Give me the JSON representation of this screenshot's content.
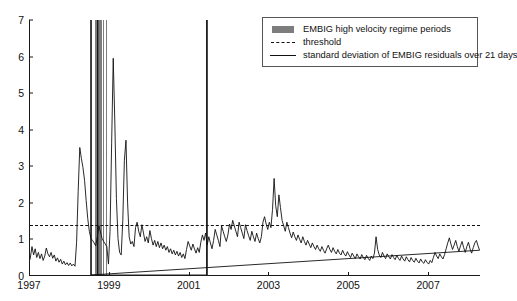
{
  "chart_data": {
    "type": "line",
    "title": "",
    "xlabel": "",
    "ylabel": "",
    "xlim": [
      1997.0,
      2008.3
    ],
    "ylim": [
      0,
      7
    ],
    "grid": false,
    "legend_position": "top-right",
    "xticks": [
      1997,
      1999,
      2001,
      2003,
      2005,
      2007
    ],
    "xtick_labels": [
      "1997",
      "1999",
      "2001",
      "2003",
      "2005",
      "2007"
    ],
    "yticks": [
      0,
      1,
      2,
      3,
      4,
      5,
      6,
      7
    ],
    "ytick_labels": [
      "0",
      "1",
      "2",
      "3",
      "4",
      "5",
      "6",
      "7"
    ],
    "threshold": 1.4,
    "colors": {
      "band": "#7d7d7d",
      "line": "#111111",
      "threshold": "#111111",
      "axis": "#1a1a1a"
    },
    "legend": [
      {
        "key": "band",
        "label": "EMBIG high velocity regime periods"
      },
      {
        "key": "dashed",
        "label": "threshold"
      },
      {
        "key": "solid",
        "label": "standard deviation of EMBIG residuals over 21 days"
      }
    ],
    "regime_bands": [
      {
        "start": 1998.52,
        "end": 1998.56
      },
      {
        "start": 1998.63,
        "end": 1998.8
      },
      {
        "start": 1998.83,
        "end": 1998.86
      },
      {
        "start": 1998.9,
        "end": 1998.93
      },
      {
        "start": 2001.42,
        "end": 2001.47
      }
    ],
    "series": [
      {
        "name": "standard deviation of EMBIG residuals over 21 days",
        "x": [
          1997.0,
          1997.05,
          1997.09,
          1997.13,
          1997.17,
          1997.21,
          1997.25,
          1997.29,
          1997.33,
          1997.37,
          1997.41,
          1997.45,
          1997.49,
          1997.53,
          1997.57,
          1997.61,
          1997.65,
          1997.69,
          1997.73,
          1997.77,
          1997.81,
          1997.85,
          1997.89,
          1997.93,
          1997.97,
          1998.01,
          1998.05,
          1998.09,
          1998.13,
          1998.17,
          1998.21,
          1998.25,
          1998.29,
          1998.33,
          1998.37,
          1998.41,
          1998.45,
          1998.49,
          1998.53,
          1998.57,
          1998.61,
          1998.65,
          1998.69,
          1998.73,
          1998.77,
          1998.81,
          1998.85,
          1998.89,
          1998.93,
          1998.97,
          1999.01,
          1999.05,
          1999.09,
          1999.13,
          1999.17,
          1999.21,
          1999.25,
          1999.29,
          1999.33,
          1999.37,
          1999.41,
          1999.45,
          1999.49,
          1999.53,
          1999.57,
          1999.61,
          1999.65,
          1999.69,
          1999.73,
          1999.77,
          1999.81,
          1999.85,
          1999.89,
          1999.93,
          1999.97,
          2000.01,
          2000.05,
          2000.09,
          2000.13,
          2000.17,
          2000.21,
          2000.25,
          2000.29,
          2000.33,
          2000.37,
          2000.41,
          2000.45,
          2000.49,
          2000.53,
          2000.57,
          2000.61,
          2000.65,
          2000.69,
          2000.73,
          2000.77,
          2000.81,
          2000.85,
          2000.89,
          2000.93,
          2000.97,
          2001.01,
          2001.05,
          2001.09,
          2001.13,
          2001.17,
          2001.21,
          2001.25,
          2001.29,
          2001.33,
          2001.37,
          2001.41,
          2001.45,
          2001.49,
          2001.53,
          2001.57,
          2001.61,
          2001.65,
          2001.69,
          2001.73,
          2001.77,
          2001.81,
          2001.85,
          2001.89,
          2001.93,
          2001.97,
          2002.01,
          2002.05,
          2002.09,
          2002.13,
          2002.17,
          2002.21,
          2002.25,
          2002.29,
          2002.33,
          2002.37,
          2002.41,
          2002.45,
          2002.49,
          2002.53,
          2002.57,
          2002.61,
          2002.65,
          2002.69,
          2002.73,
          2002.77,
          2002.81,
          2002.85,
          2002.89,
          2002.93,
          2002.97,
          2003.01,
          2003.05,
          2003.09,
          2003.13,
          2003.17,
          2003.21,
          2003.25,
          2003.29,
          2003.33,
          2003.37,
          2003.41,
          2003.45,
          2003.49,
          2003.53,
          2003.57,
          2003.61,
          2003.65,
          2003.69,
          2003.73,
          2003.77,
          2003.81,
          2003.85,
          2003.89,
          2003.93,
          2003.97,
          2004.01,
          2004.05,
          2004.09,
          2004.13,
          2004.17,
          2004.21,
          2004.25,
          2004.29,
          2004.33,
          2004.37,
          2004.41,
          2004.45,
          2004.49,
          2004.53,
          2004.57,
          2004.61,
          2004.65,
          2004.69,
          2004.73,
          2004.77,
          2004.81,
          2004.85,
          2004.89,
          2004.93,
          2004.97,
          2005.01,
          2005.05,
          2005.09,
          2005.13,
          2005.17,
          2005.21,
          2005.25,
          2005.29,
          2005.33,
          2005.37,
          2005.41,
          2005.45,
          2005.49,
          2005.53,
          2005.57,
          2005.61,
          2005.65,
          2005.69,
          2005.73,
          2005.77,
          2005.81,
          2005.85,
          2005.89,
          2005.93,
          2005.97,
          2006.01,
          2006.05,
          2006.09,
          2006.13,
          2006.17,
          2006.21,
          2006.25,
          2006.29,
          2006.33,
          2006.37,
          2006.41,
          2006.45,
          2006.49,
          2006.53,
          2006.57,
          2006.61,
          2006.65,
          2006.69,
          2006.73,
          2006.77,
          2006.81,
          2006.85,
          2006.89,
          2006.93,
          2006.97,
          2007.01,
          2007.05,
          2007.09,
          2007.13,
          2007.17,
          2007.21,
          2007.25,
          2007.29,
          2007.33,
          2007.37,
          2007.41,
          2007.45,
          2007.49,
          2007.53,
          2007.57,
          2007.61,
          2007.65,
          2007.69,
          2007.73,
          2007.77,
          2007.81,
          2007.85,
          2007.89,
          2007.93,
          2007.97,
          2008.01,
          2008.05,
          2008.09,
          2008.13,
          2008.17,
          2008.21,
          2008.25,
          2008.29
        ],
        "y": [
          0.42,
          0.78,
          0.55,
          0.72,
          0.48,
          0.62,
          0.45,
          0.58,
          0.4,
          0.52,
          0.74,
          0.58,
          0.5,
          0.62,
          0.46,
          0.55,
          0.38,
          0.47,
          0.35,
          0.43,
          0.3,
          0.38,
          0.28,
          0.34,
          0.26,
          0.33,
          0.25,
          0.3,
          0.24,
          0.9,
          2.3,
          3.5,
          3.2,
          2.95,
          2.6,
          2.05,
          1.55,
          1.2,
          1.0,
          0.95,
          0.88,
          0.8,
          1.05,
          1.35,
          1.18,
          1.0,
          0.92,
          0.85,
          0.78,
          0.3,
          1.2,
          3.6,
          5.95,
          4.2,
          2.1,
          1.0,
          0.62,
          0.55,
          1.5,
          3.15,
          3.7,
          2.0,
          1.05,
          0.85,
          0.92,
          0.78,
          1.3,
          1.45,
          1.2,
          1.05,
          1.38,
          1.15,
          0.92,
          1.05,
          0.88,
          1.22,
          1.0,
          0.82,
          0.95,
          0.78,
          0.92,
          0.75,
          0.88,
          0.72,
          0.82,
          0.68,
          0.78,
          0.62,
          0.72,
          0.58,
          0.68,
          0.55,
          0.65,
          0.52,
          0.62,
          0.48,
          0.58,
          0.45,
          0.7,
          0.92,
          0.8,
          0.68,
          0.85,
          0.72,
          0.6,
          0.75,
          0.62,
          0.9,
          1.1,
          0.95,
          1.15,
          0.82,
          1.05,
          0.88,
          0.72,
          0.95,
          1.25,
          1.1,
          0.95,
          0.78,
          1.35,
          1.2,
          1.05,
          0.92,
          1.1,
          1.4,
          1.25,
          1.5,
          1.35,
          1.2,
          1.05,
          1.45,
          1.3,
          1.15,
          1.0,
          1.38,
          1.22,
          1.08,
          0.95,
          1.2,
          1.05,
          0.92,
          1.15,
          1.0,
          0.88,
          1.05,
          1.45,
          1.6,
          1.4,
          1.25,
          1.45,
          1.3,
          1.8,
          2.65,
          1.9,
          1.6,
          2.2,
          1.85,
          1.5,
          1.35,
          1.2,
          1.45,
          1.3,
          1.15,
          1.02,
          1.18,
          1.05,
          0.95,
          1.1,
          0.98,
          0.88,
          1.05,
          0.92,
          0.82,
          0.95,
          0.85,
          0.75,
          0.88,
          0.78,
          0.7,
          0.82,
          0.72,
          0.65,
          0.78,
          0.68,
          0.6,
          0.72,
          0.82,
          0.7,
          0.62,
          0.75,
          0.65,
          0.58,
          0.7,
          0.6,
          0.55,
          0.68,
          0.58,
          0.52,
          0.64,
          0.55,
          0.48,
          0.6,
          0.52,
          0.45,
          0.58,
          0.5,
          0.44,
          0.56,
          0.48,
          0.42,
          0.54,
          0.46,
          0.4,
          0.52,
          0.45,
          0.6,
          1.05,
          0.7,
          0.55,
          0.48,
          0.62,
          0.52,
          0.45,
          0.58,
          0.5,
          0.44,
          0.56,
          0.48,
          0.42,
          0.54,
          0.46,
          0.4,
          0.52,
          0.44,
          0.38,
          0.5,
          0.42,
          0.36,
          0.48,
          0.4,
          0.35,
          0.46,
          0.38,
          0.33,
          0.44,
          0.36,
          0.32,
          0.42,
          0.35,
          0.3,
          0.4,
          0.34,
          0.48,
          0.62,
          0.52,
          0.45,
          0.58,
          0.5,
          0.44,
          0.56,
          0.72,
          0.88,
          1.02,
          0.85,
          0.7,
          0.82,
          0.95,
          0.78,
          0.65,
          0.8,
          0.92,
          0.75,
          0.62,
          0.78,
          0.9,
          0.72,
          0.6,
          0.75,
          0.88,
          0.95,
          0.8,
          0.68
        ]
      }
    ],
    "clipped_spikes": [
      {
        "x": 1998.53,
        "note": "spike extends to top of axis"
      },
      {
        "x": 1998.7,
        "note": "spike extends to top of axis"
      },
      {
        "x": 2001.44,
        "note": "spike extends to top of axis"
      }
    ]
  }
}
